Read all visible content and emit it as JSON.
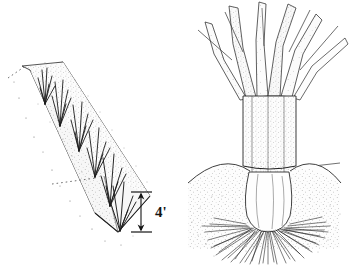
{
  "figure": {
    "background_color": "#ffffff",
    "ink_color": "#1a1a1a",
    "stipple_color": "#5a5a5a",
    "panels": [
      {
        "id": "left-panel",
        "name": "trench-planting-diagram",
        "caption": "Sloped trench with grass sprigs planted along the bottom",
        "annotations": [
          {
            "name": "trench-depth-dimension",
            "label": "4'",
            "value": 4,
            "unit": "feet",
            "style": "double-headed-arrow-with-end-caps"
          }
        ]
      },
      {
        "id": "right-panel",
        "name": "grass-plant-root-detail",
        "caption": "Grass culm with leaf sheaths, crown at soil line, and fibrous root mass below ground",
        "annotations": []
      }
    ]
  },
  "labels": {
    "depth": "4'"
  }
}
